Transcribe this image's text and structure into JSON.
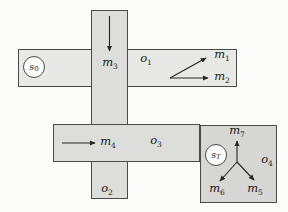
{
  "states": {
    "s0": {
      "base": "s",
      "sub": "0"
    },
    "sT": {
      "base": "s",
      "sub": "T"
    }
  },
  "options": {
    "o1": {
      "base": "o",
      "sub": "1"
    },
    "o2": {
      "base": "o",
      "sub": "2"
    },
    "o3": {
      "base": "o",
      "sub": "3"
    },
    "o4": {
      "base": "o",
      "sub": "4"
    }
  },
  "moves": {
    "m1": {
      "base": "m",
      "sub": "1"
    },
    "m2": {
      "base": "m",
      "sub": "2"
    },
    "m3": {
      "base": "m",
      "sub": "3"
    },
    "m4": {
      "base": "m",
      "sub": "4"
    },
    "m5": {
      "base": "m",
      "sub": "5"
    },
    "m6": {
      "base": "m",
      "sub": "6"
    },
    "m7": {
      "base": "m",
      "sub": "7"
    }
  },
  "colors": {
    "background": "#fbfbfa",
    "corridor_o1_fill": "#e8e8e6",
    "corridor_o2_fill": "#dddddb",
    "corridor_o3_fill": "#dddddb",
    "room_o4_fill": "#d6d6d4",
    "outline": "#4a4a48",
    "arrow": "#262626",
    "state_fill": "#ffffff",
    "text": "#1a1a1a"
  }
}
